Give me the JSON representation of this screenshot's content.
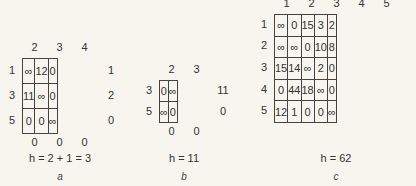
{
  "figure": {
    "panels": [
      {
        "id": "a",
        "col_headers": [
          "2",
          "3",
          "4"
        ],
        "row_headers": [
          "1",
          "3",
          "5"
        ],
        "cells": [
          [
            "∞",
            "12",
            "0"
          ],
          [
            "11",
            "∞",
            "0"
          ],
          [
            "0",
            "0",
            "∞"
          ]
        ],
        "row_reductions": [
          "1",
          "2",
          "0"
        ],
        "col_reductions": [
          "0",
          "0",
          "0"
        ],
        "caption": "h = 2 + 1 = 3",
        "label": "a"
      },
      {
        "id": "b",
        "col_headers": [
          "2",
          "3"
        ],
        "row_headers": [
          "3",
          "5"
        ],
        "cells": [
          [
            "0",
            "∞"
          ],
          [
            "∞",
            "0"
          ]
        ],
        "row_reductions": [
          "11",
          "0"
        ],
        "col_reductions": [
          "0",
          "0"
        ],
        "caption": "h = 11",
        "label": "b"
      },
      {
        "id": "c",
        "col_headers": [
          "1",
          "2",
          "3",
          "4",
          "5"
        ],
        "row_headers": [
          "1",
          "2",
          "3",
          "4",
          "5"
        ],
        "cells": [
          [
            "∞",
            "0",
            "15",
            "3",
            "2"
          ],
          [
            "∞",
            "∞",
            "0",
            "10",
            "8"
          ],
          [
            "15",
            "14",
            "∞",
            "2",
            "0"
          ],
          [
            "0",
            "44",
            "18",
            "∞",
            "0"
          ],
          [
            "12",
            "1",
            "0",
            "0",
            "∞"
          ]
        ],
        "caption": "h = 62",
        "label": "c"
      }
    ]
  }
}
